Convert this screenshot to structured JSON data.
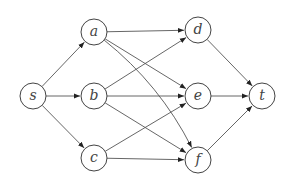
{
  "diagram": {
    "type": "directed-graph",
    "node_radius": 13,
    "colors": {
      "stroke": "#444444",
      "edge": "#555555",
      "background": "#ffffff"
    },
    "nodes": [
      {
        "id": "s",
        "label": "s",
        "x": 33,
        "y": 96
      },
      {
        "id": "a",
        "label": "a",
        "x": 94,
        "y": 32
      },
      {
        "id": "b",
        "label": "b",
        "x": 94,
        "y": 96
      },
      {
        "id": "c",
        "label": "c",
        "x": 94,
        "y": 158
      },
      {
        "id": "d",
        "label": "d",
        "x": 198,
        "y": 30
      },
      {
        "id": "e",
        "label": "e",
        "x": 198,
        "y": 96
      },
      {
        "id": "f",
        "label": "f",
        "x": 198,
        "y": 160
      },
      {
        "id": "t",
        "label": "t",
        "x": 262,
        "y": 96
      }
    ],
    "edges": [
      {
        "from": "s",
        "to": "a"
      },
      {
        "from": "s",
        "to": "b"
      },
      {
        "from": "s",
        "to": "c"
      },
      {
        "from": "a",
        "to": "d"
      },
      {
        "from": "a",
        "to": "e"
      },
      {
        "from": "a",
        "to": "f",
        "curve": 18
      },
      {
        "from": "b",
        "to": "d"
      },
      {
        "from": "b",
        "to": "e"
      },
      {
        "from": "b",
        "to": "f"
      },
      {
        "from": "c",
        "to": "e"
      },
      {
        "from": "c",
        "to": "f"
      },
      {
        "from": "d",
        "to": "t"
      },
      {
        "from": "e",
        "to": "t"
      },
      {
        "from": "f",
        "to": "t"
      }
    ]
  }
}
